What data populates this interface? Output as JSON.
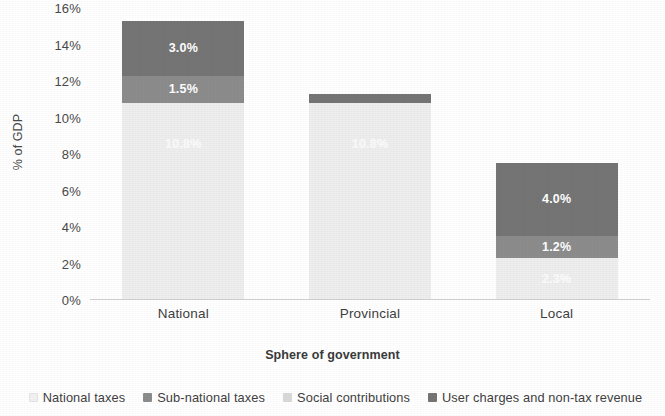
{
  "chart_data": {
    "type": "bar",
    "subtype": "stacked-bar",
    "title": "",
    "xlabel": "Sphere of government",
    "ylabel": "% of GDP",
    "categories": [
      "National",
      "Provincial",
      "Local"
    ],
    "ylim": [
      0,
      16
    ],
    "ytick_labels": [
      "0%",
      "2%",
      "4%",
      "6%",
      "8%",
      "10%",
      "12%",
      "14%",
      "16%"
    ],
    "ytick_values": [
      0,
      2,
      4,
      6,
      8,
      10,
      12,
      14,
      16
    ],
    "grid": false,
    "legend_position": "bottom",
    "series": [
      {
        "name": "National taxes",
        "color": "#eeeeee",
        "values": [
          10.8,
          10.8,
          0
        ],
        "labels": [
          "10.8%",
          "10.8%",
          ""
        ]
      },
      {
        "name": "Sub-national taxes",
        "color": "#8c8c8c",
        "values": [
          0,
          0,
          2.3
        ],
        "labels": [
          "",
          "",
          "2.3%"
        ]
      },
      {
        "name": "Social contributions",
        "color": "#d9d9d9",
        "values": [
          1.5,
          0.0,
          1.2
        ],
        "labels": [
          "1.5%",
          "",
          "1.2%"
        ]
      },
      {
        "name": "User charges and non-tax revenue",
        "color": "#757575",
        "values": [
          3.0,
          0.5,
          4.0
        ],
        "labels": [
          "3.0%",
          "",
          "4.0%"
        ]
      }
    ],
    "bars": [
      {
        "category": "National",
        "total": 15.3,
        "segments": [
          {
            "series": "National taxes",
            "value": 10.8,
            "label": "10.8%",
            "color": "#eeeeee",
            "label_faint": true
          },
          {
            "series": "Social contributions",
            "value": 1.5,
            "label": "1.5%",
            "color": "#8c8c8c",
            "label_faint": false
          },
          {
            "series": "User charges and non-tax revenue",
            "value": 3.0,
            "label": "3.0%",
            "color": "#757575",
            "label_faint": false
          }
        ]
      },
      {
        "category": "Provincial",
        "total": 11.3,
        "segments": [
          {
            "series": "National taxes",
            "value": 10.8,
            "label": "10.8%",
            "color": "#eeeeee",
            "label_faint": true
          },
          {
            "series": "User charges and non-tax revenue",
            "value": 0.5,
            "label": "",
            "color": "#757575",
            "label_faint": false
          }
        ]
      },
      {
        "category": "Local",
        "total": 7.5,
        "segments": [
          {
            "series": "Sub-national taxes",
            "value": 2.3,
            "label": "2.3%",
            "color": "#eeeeee",
            "label_faint": true
          },
          {
            "series": "Social contributions",
            "value": 1.2,
            "label": "1.2%",
            "color": "#8c8c8c",
            "label_faint": false
          },
          {
            "series": "User charges and non-tax revenue",
            "value": 4.0,
            "label": "4.0%",
            "color": "#757575",
            "label_faint": false
          }
        ]
      }
    ],
    "legend": [
      {
        "label": "National taxes",
        "color": "#f2f2f2"
      },
      {
        "label": "Sub-national taxes",
        "color": "#8c8c8c"
      },
      {
        "label": "Social contributions",
        "color": "#d9d9d9"
      },
      {
        "label": "User charges and non-tax revenue",
        "color": "#757575"
      }
    ]
  }
}
